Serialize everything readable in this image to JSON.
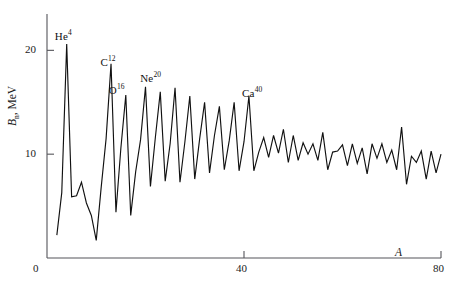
{
  "figure": {
    "background": "#ffffff",
    "line_color": "#111111",
    "axis_color": "#55555a"
  },
  "axes": {
    "x": {
      "title": "A",
      "ticks": [
        0,
        40,
        80
      ],
      "min": 0,
      "max": 80
    },
    "y": {
      "title_main": "B",
      "title_sub": "n",
      "title_unit": ", MeV",
      "ticks": [
        0,
        10,
        20
      ],
      "min": 0,
      "max": 23.5
    }
  },
  "annotations": [
    {
      "name": "he4",
      "element": "He",
      "mass": "4",
      "x_pct": 11.9,
      "y_pct": 9.5
    },
    {
      "name": "c12",
      "element": "C",
      "mass": "12",
      "x_pct": 21.8,
      "y_pct": 18.6
    },
    {
      "name": "o16",
      "element": "O",
      "mass": "16",
      "x_pct": 23.6,
      "y_pct": 28.2
    },
    {
      "name": "ne20",
      "element": "Ne",
      "mass": "20",
      "x_pct": 30.4,
      "y_pct": 24.1
    },
    {
      "name": "ca40",
      "element": "Ca",
      "mass": "40",
      "x_pct": 52.5,
      "y_pct": 29.2
    }
  ],
  "chart_data": {
    "type": "line",
    "title": "",
    "xlabel": "A",
    "ylabel": "B_n, MeV",
    "xlim": [
      0,
      80
    ],
    "ylim": [
      0,
      23.5
    ],
    "grid": false,
    "legend": null,
    "series": [
      {
        "name": "neutron separation energy",
        "x": [
          2,
          3,
          4,
          5,
          6,
          7,
          8,
          9,
          10,
          11,
          12,
          13,
          14,
          15,
          16,
          17,
          18,
          19,
          20,
          21,
          22,
          23,
          24,
          25,
          26,
          27,
          28,
          29,
          30,
          31,
          32,
          33,
          34,
          35,
          36,
          37,
          38,
          39,
          40,
          41,
          42,
          43,
          44,
          45,
          46,
          47,
          48,
          49,
          50,
          51,
          52,
          53,
          54,
          55,
          56,
          57,
          58,
          59,
          60,
          61,
          62,
          63,
          64,
          65,
          66,
          67,
          68,
          69,
          70,
          71,
          72,
          73,
          74,
          75,
          76,
          77,
          78,
          79,
          80
        ],
        "values": [
          2.2,
          6.3,
          20.6,
          5.9,
          6.0,
          7.3,
          5.3,
          4.1,
          1.7,
          6.8,
          11.5,
          18.7,
          4.4,
          10.6,
          15.7,
          4.1,
          8.3,
          11.4,
          16.5,
          6.9,
          11.6,
          16.0,
          7.4,
          11.0,
          16.4,
          7.3,
          11.2,
          15.6,
          7.6,
          11.5,
          15.0,
          8.2,
          11.8,
          14.6,
          8.5,
          11.3,
          15.0,
          8.4,
          11.2,
          15.6,
          8.4,
          10.2,
          11.6,
          9.7,
          11.8,
          10.1,
          12.4,
          9.2,
          11.8,
          9.4,
          11.1,
          10.0,
          11.0,
          9.4,
          12.1,
          8.5,
          10.2,
          10.3,
          10.9,
          8.9,
          11.0,
          9.1,
          10.6,
          8.1,
          11.0,
          9.6,
          11.0,
          9.2,
          10.4,
          8.5,
          12.6,
          7.1,
          9.8,
          9.2,
          10.3,
          7.6,
          10.3,
          8.2,
          10.0
        ]
      }
    ]
  }
}
